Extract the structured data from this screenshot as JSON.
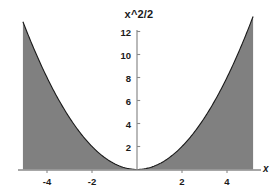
{
  "chart_data": {
    "type": "area",
    "title": "x^2/2",
    "xlabel": "x",
    "ylabel": "",
    "expression": "x^2/2",
    "xlim": [
      -5.07,
      5.16
    ],
    "ylim": [
      0,
      13.3
    ],
    "grid": false,
    "legend": null,
    "fill_color": "#808080",
    "line_color": "#1a1a1a",
    "axis_color": "#808080",
    "background_color": "#ffffff",
    "xticks": [
      -4,
      -2,
      2,
      4
    ],
    "xtick_labels": [
      "-4",
      "-2",
      "2",
      "4"
    ],
    "yticks": [
      2,
      4,
      6,
      8,
      10,
      12
    ],
    "ytick_labels": [
      "2",
      "4",
      "6",
      "8",
      "10",
      "12"
    ],
    "x": [
      -5.07,
      -4.8,
      -4.5,
      -4.2,
      -3.9,
      -3.6,
      -3.3,
      -3.0,
      -2.7,
      -2.4,
      -2.1,
      -1.8,
      -1.5,
      -1.2,
      -0.9,
      -0.6,
      -0.3,
      0.0,
      0.3,
      0.6,
      0.9,
      1.2,
      1.5,
      1.8,
      2.1,
      2.4,
      2.7,
      3.0,
      3.3,
      3.6,
      3.9,
      4.2,
      4.5,
      4.8,
      5.16
    ],
    "values": [
      12.85,
      11.52,
      10.13,
      8.82,
      7.61,
      6.48,
      5.45,
      4.5,
      3.65,
      2.88,
      2.21,
      1.62,
      1.13,
      0.72,
      0.41,
      0.18,
      0.05,
      0.0,
      0.05,
      0.18,
      0.41,
      0.72,
      1.13,
      1.62,
      2.21,
      2.88,
      3.65,
      4.5,
      5.45,
      6.48,
      7.61,
      8.82,
      10.13,
      11.52,
      13.31
    ]
  },
  "axis_label_x": "x"
}
